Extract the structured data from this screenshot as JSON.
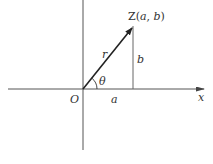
{
  "diagram": {
    "colors": {
      "axis": "#555555",
      "vector": "#222222",
      "text": "#333333",
      "background": "#ffffff"
    },
    "labels": {
      "point": "Z(a, b)",
      "point_prefix": "Z(",
      "point_a": "a",
      "point_sep": ", ",
      "point_b": "b",
      "point_suffix": ")",
      "modulus": "r",
      "angle": "θ",
      "origin": "O",
      "x_axis": "x",
      "horizontal_leg": "a",
      "vertical_leg": "b"
    },
    "geometry": {
      "origin": [
        83,
        89
      ],
      "point": [
        133,
        26
      ],
      "x_axis_range": [
        8,
        205
      ],
      "y_axis_range": [
        0,
        150
      ]
    }
  }
}
